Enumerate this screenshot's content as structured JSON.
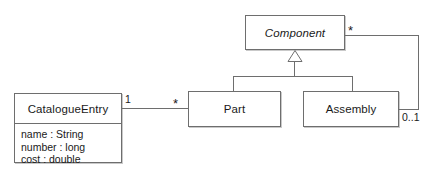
{
  "diagram": {
    "type": "uml-class-diagram",
    "title": "",
    "stroke_color": "#6e6e6e",
    "text_color": "#1a1a1a",
    "background": "#ffffff",
    "classes": [
      {
        "id": "catalogue-entry",
        "name": "CatalogueEntry",
        "abstract": false,
        "attributes": [
          "name : String",
          "number : long",
          "cost : double"
        ]
      },
      {
        "id": "component",
        "name": "Component",
        "abstract": true,
        "attributes": []
      },
      {
        "id": "part",
        "name": "Part",
        "abstract": false,
        "attributes": []
      },
      {
        "id": "assembly",
        "name": "Assembly",
        "abstract": false,
        "attributes": []
      }
    ],
    "relationships": [
      {
        "id": "catalogue-part-association",
        "kind": "association",
        "from": "catalogue-entry",
        "to": "part",
        "from_multiplicity": "1",
        "to_multiplicity": "*"
      },
      {
        "id": "part-component-generalization",
        "kind": "generalization",
        "from": "part",
        "to": "component"
      },
      {
        "id": "assembly-component-generalization",
        "kind": "generalization",
        "from": "assembly",
        "to": "component"
      },
      {
        "id": "assembly-component-aggregation",
        "kind": "association",
        "from": "assembly",
        "to": "component",
        "from_multiplicity": "0..1",
        "to_multiplicity": "*"
      }
    ],
    "multiplicity_labels": {
      "catalogue_side": "1",
      "part_side": "*",
      "component_side": "*",
      "assembly_side": "0..1"
    }
  }
}
